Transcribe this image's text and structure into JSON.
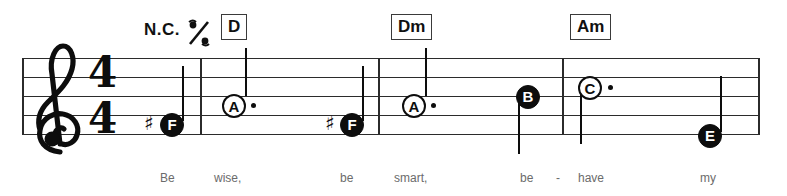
{
  "score": {
    "clef": "treble-clef",
    "time_signature": {
      "numerator": "4",
      "denominator": "4"
    },
    "staff": {
      "line_count": 5,
      "color": "#2b2b2b"
    },
    "ink_color": "#0d0d0d",
    "page_background": "#ffffff"
  },
  "chord_row": {
    "no_chord_label": "N.C.",
    "simile_symbol": "measure-repeat-percent",
    "chords": [
      {
        "label": "D",
        "x": 221
      },
      {
        "label": "Dm",
        "x": 391
      },
      {
        "label": "Am",
        "x": 570
      }
    ]
  },
  "measures": [
    {
      "index": 1,
      "notes": [
        {
          "name": "F",
          "accidental": "♯",
          "head": "filled",
          "stem": "up",
          "dotted": false
        }
      ]
    },
    {
      "index": 2,
      "notes": [
        {
          "name": "A",
          "accidental": "",
          "head": "hollow",
          "stem": "up",
          "dotted": true
        },
        {
          "name": "F",
          "accidental": "♯",
          "head": "filled",
          "stem": "up",
          "dotted": false
        }
      ]
    },
    {
      "index": 3,
      "notes": [
        {
          "name": "A",
          "accidental": "",
          "head": "hollow",
          "stem": "up",
          "dotted": true
        },
        {
          "name": "B",
          "accidental": "",
          "head": "filled",
          "stem": "down",
          "dotted": false
        }
      ]
    },
    {
      "index": 4,
      "notes": [
        {
          "name": "C",
          "accidental": "",
          "head": "hollow",
          "stem": "down",
          "dotted": true
        },
        {
          "name": "E",
          "accidental": "",
          "head": "filled",
          "stem": "up",
          "dotted": false
        }
      ]
    }
  ],
  "note_labels": {
    "n1": "F",
    "n2": "A",
    "n3": "F",
    "n4": "A",
    "n5": "B",
    "n6": "C",
    "n7": "E"
  },
  "accidentals": {
    "a1": "♯",
    "a3": "♯"
  },
  "lyrics": {
    "line": "Be wise, be smart, be - have my",
    "syllables": [
      {
        "text": "Be",
        "x": 160
      },
      {
        "text": "wise,",
        "x": 214
      },
      {
        "text": "be",
        "x": 340
      },
      {
        "text": "smart,",
        "x": 394
      },
      {
        "text": "be",
        "x": 520
      },
      {
        "text": "-",
        "x": 556
      },
      {
        "text": "have",
        "x": 578
      },
      {
        "text": "my",
        "x": 700
      }
    ]
  }
}
